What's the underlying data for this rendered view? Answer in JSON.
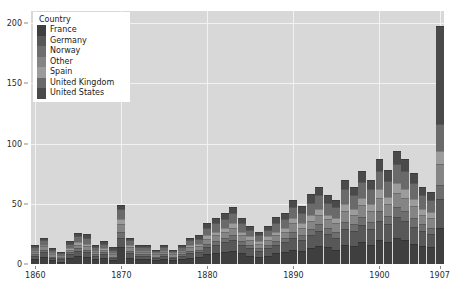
{
  "chart_data": {
    "type": "bar",
    "title": "",
    "xlabel": "",
    "ylabel": "",
    "stacked": true,
    "grid": true,
    "legend_position": "upper-left",
    "legend_title": "Country",
    "xlim": [
      1859.5,
      1907.5
    ],
    "ylim": [
      0,
      210
    ],
    "ytick_labels": [
      "0",
      "50",
      "100",
      "150",
      "200"
    ],
    "ytick_values": [
      0,
      50,
      100,
      150,
      200
    ],
    "xtick_labels": [
      "1860",
      "1870",
      "1880",
      "1890",
      "1900",
      "1907"
    ],
    "xtick_values": [
      1860,
      1870,
      1880,
      1890,
      1900,
      1907
    ],
    "categories": [
      1860,
      1861,
      1862,
      1863,
      1864,
      1865,
      1866,
      1867,
      1868,
      1869,
      1870,
      1871,
      1872,
      1873,
      1874,
      1875,
      1876,
      1877,
      1878,
      1879,
      1880,
      1881,
      1882,
      1883,
      1884,
      1885,
      1886,
      1887,
      1888,
      1889,
      1890,
      1891,
      1892,
      1893,
      1894,
      1895,
      1896,
      1897,
      1898,
      1899,
      1900,
      1901,
      1902,
      1903,
      1904,
      1905,
      1906,
      1907
    ],
    "series": [
      {
        "name": "France",
        "color": "#3f3f3f",
        "values": [
          4,
          6,
          3,
          2,
          5,
          7,
          6,
          4,
          5,
          3,
          14,
          5,
          4,
          4,
          3,
          4,
          3,
          4,
          5,
          6,
          8,
          9,
          10,
          11,
          9,
          7,
          6,
          7,
          9,
          10,
          12,
          11,
          13,
          15,
          14,
          12,
          16,
          15,
          18,
          16,
          20,
          18,
          22,
          20,
          17,
          15,
          14,
          30
        ]
      },
      {
        "name": "Germany",
        "color": "#585858",
        "values": [
          3,
          4,
          2,
          2,
          3,
          4,
          4,
          3,
          3,
          2,
          8,
          4,
          3,
          3,
          2,
          3,
          2,
          3,
          4,
          4,
          6,
          7,
          8,
          9,
          7,
          6,
          5,
          6,
          7,
          8,
          10,
          9,
          11,
          12,
          11,
          10,
          13,
          12,
          14,
          13,
          16,
          15,
          17,
          16,
          14,
          12,
          11,
          24
        ]
      },
      {
        "name": "Norway",
        "color": "#6e6e6e",
        "values": [
          1,
          2,
          1,
          1,
          2,
          2,
          2,
          1,
          2,
          1,
          5,
          2,
          1,
          1,
          1,
          1,
          1,
          1,
          2,
          2,
          3,
          3,
          4,
          4,
          3,
          3,
          2,
          3,
          3,
          4,
          5,
          4,
          5,
          6,
          5,
          5,
          6,
          6,
          7,
          6,
          8,
          7,
          8,
          8,
          7,
          6,
          5,
          12
        ]
      },
      {
        "name": "Other",
        "color": "#858585",
        "values": [
          2,
          3,
          2,
          1,
          2,
          3,
          3,
          2,
          2,
          2,
          6,
          3,
          2,
          2,
          2,
          2,
          2,
          2,
          3,
          3,
          4,
          5,
          5,
          6,
          5,
          4,
          4,
          4,
          5,
          5,
          7,
          6,
          7,
          8,
          7,
          7,
          9,
          8,
          10,
          9,
          11,
          10,
          12,
          11,
          10,
          8,
          8,
          17
        ]
      },
      {
        "name": "Spain",
        "color": "#9c9c9c",
        "values": [
          1,
          1,
          1,
          1,
          1,
          2,
          2,
          1,
          1,
          1,
          4,
          2,
          1,
          1,
          1,
          1,
          1,
          1,
          2,
          2,
          3,
          3,
          3,
          4,
          3,
          3,
          2,
          3,
          3,
          3,
          4,
          4,
          5,
          5,
          4,
          4,
          6,
          5,
          6,
          6,
          7,
          6,
          8,
          7,
          6,
          5,
          5,
          11
        ]
      },
      {
        "name": "United Kingdom",
        "color": "#6a6a6a",
        "values": [
          3,
          4,
          3,
          2,
          4,
          5,
          5,
          3,
          4,
          3,
          9,
          4,
          3,
          3,
          2,
          3,
          2,
          3,
          4,
          4,
          6,
          7,
          7,
          8,
          7,
          5,
          5,
          5,
          7,
          7,
          9,
          8,
          10,
          11,
          10,
          9,
          12,
          11,
          13,
          12,
          15,
          13,
          16,
          15,
          13,
          11,
          10,
          22
        ]
      },
      {
        "name": "United States",
        "color": "#4a4a4a",
        "values": [
          2,
          2,
          1,
          1,
          2,
          3,
          3,
          2,
          2,
          2,
          3,
          2,
          2,
          2,
          1,
          2,
          1,
          2,
          2,
          3,
          4,
          4,
          5,
          5,
          4,
          4,
          3,
          4,
          5,
          5,
          6,
          6,
          7,
          7,
          6,
          6,
          8,
          7,
          9,
          8,
          10,
          9,
          11,
          10,
          9,
          7,
          7,
          82
        ]
      }
    ]
  }
}
